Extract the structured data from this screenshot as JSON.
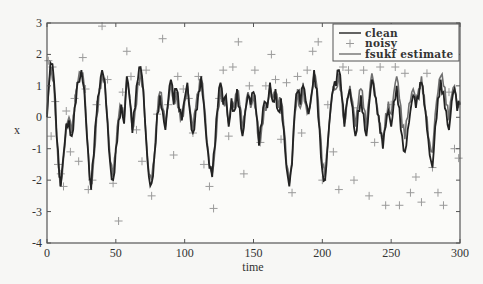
{
  "chart_data": {
    "type": "line",
    "title": "",
    "xlabel": "time",
    "ylabel": "x",
    "xlim": [
      0,
      300
    ],
    "ylim": [
      -4,
      3
    ],
    "xticks": [
      0,
      50,
      100,
      150,
      200,
      250,
      300
    ],
    "yticks": [
      3,
      2,
      1,
      0,
      -1,
      -2,
      -3,
      -4
    ],
    "grid": false,
    "legend_position": "upper right",
    "legend": [
      "clean",
      "noisy",
      "fsukf estimate"
    ],
    "series": [
      {
        "name": "clean",
        "style": "line",
        "color": "#222222",
        "t": [
          0,
          2,
          3,
          5,
          7,
          9,
          10,
          12,
          14,
          16,
          18,
          20,
          22,
          25,
          27,
          29,
          31,
          32,
          34,
          36,
          38,
          40,
          42,
          44,
          46,
          48,
          50,
          52,
          54,
          56,
          58,
          60,
          62,
          64,
          66,
          68,
          70,
          72,
          74,
          76,
          78,
          80,
          82,
          84,
          86,
          88,
          90,
          92,
          94,
          96,
          98,
          100,
          102,
          104,
          106,
          108,
          110,
          112,
          114,
          116,
          118,
          120,
          122,
          124,
          126,
          128,
          130,
          132,
          134,
          136,
          138,
          140,
          142,
          144,
          146,
          148,
          150,
          152,
          154,
          156,
          158,
          160,
          162,
          164,
          166,
          168,
          170,
          172,
          174,
          176,
          178,
          180,
          182,
          184,
          186,
          188,
          190,
          192,
          194,
          196,
          198,
          200,
          202,
          204,
          206,
          208,
          210,
          212,
          214,
          216,
          218,
          220,
          222,
          224,
          226,
          228,
          230,
          232,
          234,
          236,
          238,
          240,
          242,
          244,
          246,
          248,
          250,
          252,
          254,
          256,
          258,
          260,
          262,
          264,
          266,
          268,
          270,
          272,
          274,
          276,
          278,
          280,
          282,
          284,
          286,
          288,
          290,
          292,
          294,
          296,
          298,
          300
        ],
        "values": [
          0.0,
          1.4,
          1.7,
          1.2,
          -0.6,
          -1.9,
          -2.2,
          -1.2,
          -0.2,
          -0.1,
          -0.6,
          0.3,
          1.1,
          1.5,
          0.9,
          -0.6,
          -2.0,
          -2.3,
          -1.2,
          0.1,
          0.8,
          1.5,
          1.1,
          -0.2,
          -1.5,
          -2.0,
          -1.0,
          -0.1,
          0.4,
          -0.2,
          1.3,
          0.6,
          -0.5,
          0.3,
          1.2,
          1.6,
          0.8,
          -0.7,
          -1.9,
          -2.1,
          -1.2,
          0.1,
          0.7,
          0.2,
          -0.4,
          0.5,
          1.2,
          0.4,
          0.9,
          0.2,
          -0.1,
          0.6,
          1.1,
          0.1,
          -0.5,
          0.2,
          0.8,
          1.3,
          0.4,
          -0.8,
          -1.6,
          -1.9,
          -0.9,
          0.3,
          1.1,
          0.4,
          0.7,
          -0.3,
          0.6,
          0.2,
          0.9,
          0.3,
          -0.6,
          0.2,
          0.7,
          0.4,
          0.8,
          0.1,
          -0.9,
          -0.2,
          0.5,
          0.3,
          1.1,
          0.5,
          0.9,
          0.2,
          0.6,
          -0.4,
          -1.6,
          -2.2,
          -1.5,
          0.2,
          0.8,
          0.4,
          1.0,
          0.5,
          0.1,
          0.7,
          1.5,
          0.9,
          -0.4,
          -1.7,
          -2.0,
          -0.8,
          0.3,
          0.9,
          1.0,
          1.5,
          0.7,
          -0.3,
          0.5,
          0.9,
          0.3,
          -0.6,
          0.2,
          0.7,
          0.1,
          -0.6,
          0.4,
          1.2,
          0.7,
          0.1,
          -0.5,
          -1.0,
          -0.3,
          0.2,
          -0.3,
          0.5,
          1.0,
          0.3,
          -0.6,
          -1.1,
          -0.4,
          0.2,
          0.7,
          0.3,
          0.6,
          1.1,
          0.4,
          -0.4,
          -1.2,
          -1.6,
          -0.3,
          0.6,
          1.2,
          0.8,
          0.2,
          -0.4,
          0.5,
          0.9,
          0.2,
          0.4,
          0.1
        ]
      },
      {
        "name": "fsukf estimate",
        "style": "line",
        "color": "#707070",
        "t": [
          0,
          2,
          3,
          5,
          7,
          9,
          10,
          12,
          14,
          16,
          18,
          20,
          22,
          25,
          27,
          29,
          31,
          32,
          34,
          36,
          38,
          40,
          42,
          44,
          46,
          48,
          50,
          52,
          54,
          56,
          58,
          60,
          62,
          64,
          66,
          68,
          70,
          72,
          74,
          76,
          78,
          80,
          82,
          84,
          86,
          88,
          90,
          92,
          94,
          96,
          98,
          100,
          102,
          104,
          106,
          108,
          110,
          112,
          114,
          116,
          118,
          120,
          122,
          124,
          126,
          128,
          130,
          132,
          134,
          136,
          138,
          140,
          142,
          144,
          146,
          148,
          150,
          152,
          154,
          156,
          158,
          160,
          162,
          164,
          166,
          168,
          170,
          172,
          174,
          176,
          178,
          180,
          182,
          184,
          186,
          188,
          190,
          192,
          194,
          196,
          198,
          200,
          202,
          204,
          206,
          208,
          210,
          212,
          214,
          216,
          218,
          220,
          222,
          224,
          226,
          228,
          230,
          232,
          234,
          236,
          238,
          240,
          242,
          244,
          246,
          248,
          250,
          252,
          254,
          256,
          258,
          260,
          262,
          264,
          266,
          268,
          270,
          272,
          274,
          276,
          278,
          280,
          282,
          284,
          286,
          288,
          290,
          292,
          294,
          296,
          298,
          300
        ],
        "values": [
          0.1,
          1.3,
          1.6,
          1.1,
          -0.5,
          -1.8,
          -2.1,
          -1.3,
          -0.3,
          0.0,
          -0.5,
          0.2,
          1.0,
          1.4,
          1.0,
          -0.5,
          -1.9,
          -2.2,
          -1.3,
          0.0,
          0.9,
          1.4,
          1.2,
          -0.1,
          -1.4,
          -1.9,
          -1.1,
          0.0,
          0.3,
          -0.1,
          1.2,
          0.7,
          -0.4,
          0.2,
          1.1,
          1.5,
          0.9,
          -0.6,
          -1.8,
          -2.0,
          -1.3,
          0.0,
          0.8,
          0.3,
          -0.3,
          0.4,
          1.1,
          0.5,
          0.8,
          0.3,
          0.0,
          0.5,
          1.0,
          0.2,
          -0.4,
          0.3,
          0.7,
          1.2,
          0.5,
          -0.7,
          -1.5,
          -1.8,
          -1.0,
          0.2,
          1.0,
          0.5,
          0.6,
          -0.2,
          0.5,
          0.3,
          0.8,
          0.4,
          -0.5,
          0.1,
          0.8,
          0.3,
          0.7,
          0.2,
          -0.8,
          -0.3,
          0.4,
          0.4,
          1.0,
          0.6,
          0.8,
          0.3,
          0.5,
          -0.3,
          -1.5,
          -2.1,
          -1.4,
          0.1,
          0.9,
          0.3,
          1.1,
          0.4,
          0.2,
          0.6,
          1.4,
          1.0,
          -0.3,
          -1.6,
          -1.9,
          -0.9,
          0.2,
          1.0,
          0.9,
          1.4,
          0.8,
          -0.2,
          0.6,
          1.0,
          0.5,
          -0.3,
          0.4,
          0.9,
          0.3,
          -0.4,
          0.6,
          1.4,
          0.9,
          0.3,
          -0.2,
          -0.6,
          0.1,
          0.5,
          0.1,
          0.8,
          1.3,
          0.6,
          -0.3,
          -0.7,
          0.0,
          0.5,
          0.9,
          0.6,
          0.9,
          1.3,
          0.7,
          0.0,
          -0.8,
          -1.1,
          0.1,
          0.8,
          1.3,
          1.0,
          0.4,
          -0.1,
          0.7,
          1.0,
          0.4,
          0.5,
          0.3
        ]
      },
      {
        "name": "noisy",
        "style": "markers",
        "marker": "+",
        "color": "#9a9a9a",
        "t": [
          1,
          3,
          4,
          6,
          8,
          10,
          12,
          14,
          17,
          20,
          23,
          26,
          28,
          30,
          33,
          36,
          40,
          44,
          48,
          52,
          55,
          58,
          61,
          65,
          69,
          72,
          76,
          80,
          84,
          88,
          92,
          95,
          99,
          103,
          106,
          110,
          114,
          118,
          121,
          125,
          128,
          132,
          135,
          139,
          143,
          147,
          151,
          155,
          159,
          163,
          166,
          170,
          174,
          178,
          182,
          185,
          189,
          193,
          197,
          200,
          204,
          208,
          212,
          215,
          219,
          223,
          226,
          230,
          234,
          238,
          242,
          246,
          250,
          253,
          256,
          260,
          264,
          268,
          272,
          276,
          280,
          284,
          288,
          292,
          296,
          299
        ],
        "values": [
          1.8,
          -0.6,
          1.6,
          0.5,
          -1.5,
          -1.8,
          -2.2,
          0.2,
          -1.1,
          0.6,
          -1.4,
          1.9,
          0.9,
          -2.3,
          -2.0,
          0.4,
          2.9,
          1.2,
          -2.1,
          -3.3,
          0.8,
          2.1,
          1.3,
          -0.4,
          -1.4,
          1.5,
          -2.5,
          0.1,
          2.5,
          0.4,
          -1.2,
          1.3,
          0.9,
          0.6,
          -0.5,
          1.3,
          -1.5,
          -2.2,
          -2.9,
          0.6,
          1.5,
          -0.6,
          1.6,
          2.4,
          -1.8,
          1.0,
          1.5,
          -0.8,
          1.0,
          2.0,
          1.2,
          -0.7,
          1.1,
          -2.4,
          1.3,
          -0.5,
          1.5,
          2.1,
          2.4,
          -2.0,
          0.4,
          -1.1,
          -2.3,
          1.6,
          1.5,
          -2.0,
          0.3,
          1.5,
          -2.5,
          -0.8,
          1.6,
          -2.8,
          0.4,
          1.6,
          -2.8,
          1.4,
          -2.4,
          -1.9,
          -2.7,
          1.4,
          -1.6,
          -2.4,
          -2.8,
          0.8,
          -1.0,
          -1.3
        ]
      }
    ]
  },
  "axes": {
    "xlabel": "time",
    "ylabel": "x",
    "xtick_labels": [
      "0",
      "50",
      "100",
      "150",
      "200",
      "250",
      "300"
    ],
    "ytick_labels": [
      "3",
      "2",
      "1",
      "0",
      "-1",
      "-2",
      "-3",
      "-4"
    ]
  },
  "legend": {
    "items": [
      {
        "label": "clean",
        "style": "line",
        "color": "#222222"
      },
      {
        "label": "noisy",
        "style": "marker",
        "color": "#9a9a9a"
      },
      {
        "label": "fsukf estimate",
        "style": "line",
        "color": "#707070"
      }
    ]
  },
  "colors": {
    "background": "#f7f7f5",
    "axes": "#555555",
    "clean": "#222222",
    "estimate": "#707070",
    "noisy": "#9a9a9a"
  }
}
